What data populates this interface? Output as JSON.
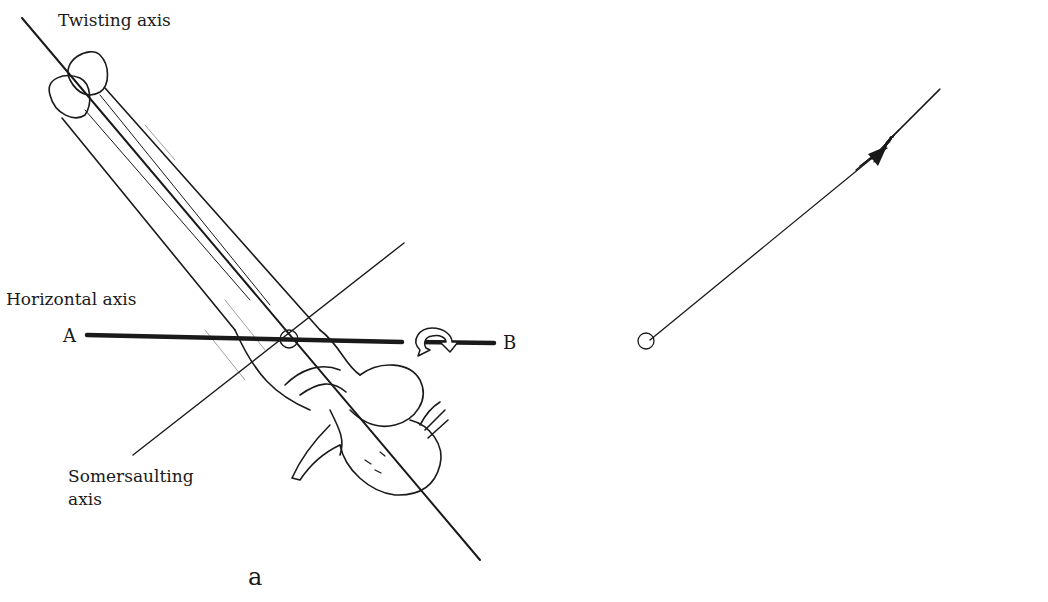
{
  "figure": {
    "panels": [
      {
        "id": "a",
        "caption": "a",
        "labels": {
          "twisting_axis": "Twisting axis",
          "horizontal_axis": "Horizontal axis",
          "somersaulting_axis_line1": "Somersaulting",
          "somersaulting_axis_line2": "axis"
        },
        "points": {
          "A": "A",
          "B": "B"
        }
      },
      {
        "id": "b",
        "caption": "b",
        "labels": {
          "somersaulting_momentum_line1": "Somersaulting",
          "somersaulting_momentum_line2": "momentum",
          "total_angular_momentum": "Total angular momentum",
          "twisting_momentum_line1": "Twisting",
          "twisting_momentum_line2": "momentum"
        },
        "points": {
          "O": "O",
          "B": "B",
          "C": "C",
          "D": "D"
        }
      }
    ],
    "colors": {
      "ink": "#1a1a1a",
      "background": "#ffffff"
    }
  }
}
